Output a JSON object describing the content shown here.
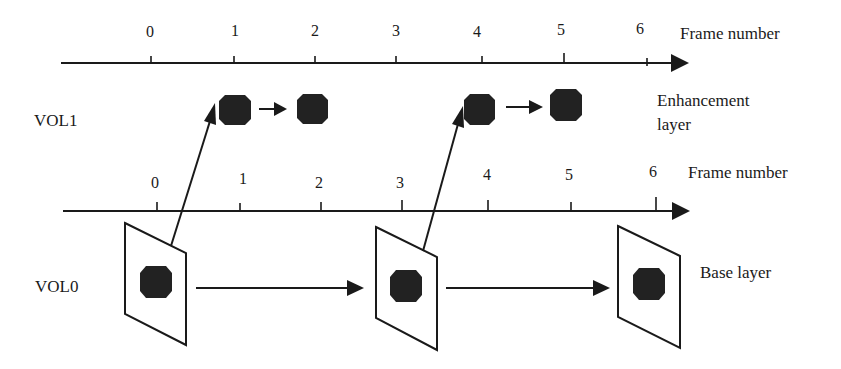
{
  "colors": {
    "ink": "#1a1a1a",
    "object_fill": "#222222",
    "background": "#ffffff"
  },
  "top_axis": {
    "label": "Frame number",
    "ticks": [
      "0",
      "1",
      "2",
      "3",
      "4",
      "5",
      "6"
    ]
  },
  "bottom_axis": {
    "label": "Frame number",
    "ticks": [
      "0",
      "1",
      "2",
      "3",
      "4",
      "5",
      "6"
    ]
  },
  "layers": {
    "enhancement": {
      "row_label": "VOL1",
      "side_label_line1": "Enhancement",
      "side_label_line2": "layer",
      "frames": [
        "1",
        "2",
        "4",
        "5"
      ]
    },
    "base": {
      "row_label": "VOL0",
      "side_label": "Base layer",
      "frames": [
        "0",
        "3",
        "6"
      ]
    }
  },
  "relations": [
    {
      "from": "VOL0 frame 0",
      "to": "VOL1 frame 1",
      "type": "spatial prediction"
    },
    {
      "from": "VOL0 frame 3",
      "to": "VOL1 frame 4",
      "type": "spatial prediction"
    },
    {
      "from": "VOL1 frame 1",
      "to": "VOL1 frame 2",
      "type": "temporal prediction"
    },
    {
      "from": "VOL1 frame 4",
      "to": "VOL1 frame 5",
      "type": "temporal prediction"
    },
    {
      "from": "VOL0 frame 0",
      "to": "VOL0 frame 3",
      "type": "temporal prediction"
    },
    {
      "from": "VOL0 frame 3",
      "to": "VOL0 frame 6",
      "type": "temporal prediction"
    }
  ]
}
